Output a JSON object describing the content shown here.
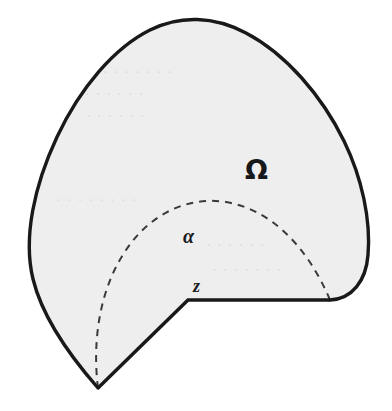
{
  "figure": {
    "type": "geometry-diagram",
    "caption_labels": {
      "region_label": "Ω",
      "arc_label": "α",
      "vertex_label": "z"
    },
    "colors": {
      "page_background": "#ffffff",
      "region_fill": "#eeeeee",
      "outline": "#191919",
      "dashed_arc": "#3a3a3a",
      "bleed_text": "#d7d9db"
    },
    "geometry": {
      "region_description": "closed blob-shaped domain with a wedge notch removed from the lower left",
      "notch_vertex": {
        "label": "z",
        "x": 188,
        "y": 300
      },
      "notch_bottom_vertex": {
        "x": 98,
        "y": 388
      },
      "notch_right_end": {
        "x": 330,
        "y": 300
      },
      "arc_center": {
        "x": 188,
        "y": 300
      },
      "arc_radius": 142,
      "arc_start_angle_deg": 180,
      "arc_end_angle_deg": 0,
      "outline_width_px": 3.2,
      "dash_pattern": "7 6"
    },
    "label_positions": {
      "omega": {
        "x": 245,
        "y": 179
      },
      "alpha": {
        "x": 183,
        "y": 243
      },
      "z": {
        "x": 193,
        "y": 292
      }
    },
    "bleed_through_lines": [
      "· · · · · · · ·",
      "· · · · · · ·",
      "· · · · · ·",
      "· · · · · · · ·",
      "· · · · · ·",
      "· · · · · · ·"
    ]
  }
}
